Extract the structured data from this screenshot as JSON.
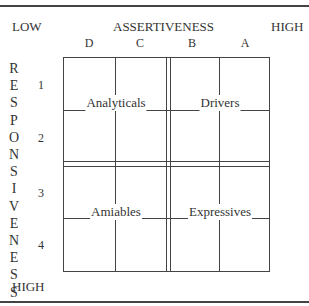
{
  "header": {
    "low_label": "LOW",
    "axis_title": "ASSERTIVENESS",
    "high_label": "HIGH"
  },
  "columns": [
    "D",
    "C",
    "B",
    "A"
  ],
  "rows": [
    "1",
    "2",
    "3",
    "4"
  ],
  "vertical_axis": {
    "title": "RESPONSIVENESS",
    "letters": [
      "R",
      "E",
      "S",
      "P",
      "O",
      "N",
      "S",
      "I",
      "V",
      "E",
      "N",
      "E",
      "S",
      "S"
    ],
    "bottom_label": "HIGH"
  },
  "quadrants": {
    "top_left": "Analyticals",
    "top_right": "Drivers",
    "bottom_left": "Amiables",
    "bottom_right": "Expressives"
  }
}
